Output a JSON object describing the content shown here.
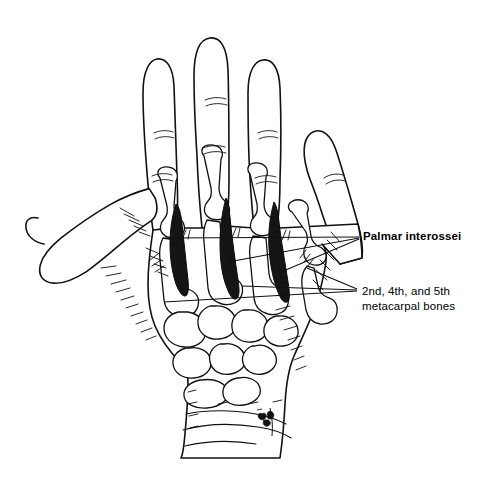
{
  "figure": {
    "view": "anterior / palmar view of right hand with skin outlined and bones shown",
    "background_color": "#ffffff",
    "line_color": "#111111",
    "muscle_fill_color": "#151515"
  },
  "labels": {
    "primary": {
      "text": "Palmar interossei",
      "weight": "bold",
      "leader_count": 3
    },
    "secondary": {
      "text": "2nd, 4th, and 5th\nmetacarpal bones",
      "weight": "normal",
      "leader_count": 3
    }
  },
  "annotations": {
    "signature_mark": "artist-signature"
  }
}
